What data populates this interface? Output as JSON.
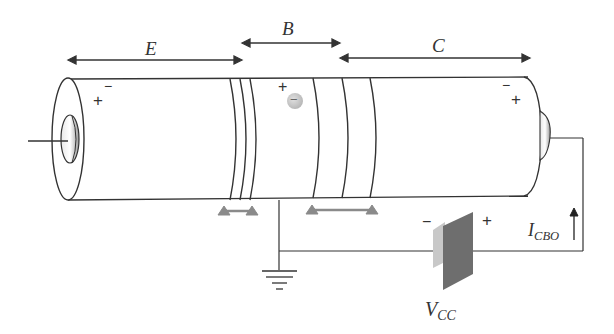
{
  "diagram": {
    "regions": [
      {
        "id": "emitter",
        "label": "E"
      },
      {
        "id": "base",
        "label": "B"
      },
      {
        "id": "collector",
        "label": "C"
      }
    ],
    "charges": {
      "emitter_plus": "+",
      "emitter_minus": "−",
      "base_plus": "+",
      "base_minus_carrier": "−",
      "collector_minus": "−",
      "collector_plus": "+"
    },
    "battery": {
      "label_main": "V",
      "label_sub": "CC",
      "minus": "−",
      "plus": "+"
    },
    "current": {
      "label_main": "I",
      "label_sub": "CBO"
    },
    "colors": {
      "line": "#333333",
      "depletion_marker": "#8a8a8a",
      "battery_dark": "#6e6e6e",
      "battery_light": "#c8c8c8",
      "carrier": "#c0c0c0"
    }
  }
}
